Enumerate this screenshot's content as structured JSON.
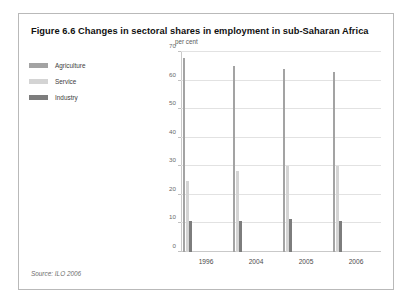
{
  "figure": {
    "title": "Figure 6.6 Changes in sectoral shares in employment in sub-Saharan Africa",
    "source": "Source: ILO 2006"
  },
  "legend": {
    "items": [
      {
        "label": "Agriculture",
        "color": "#a3a3a3"
      },
      {
        "label": "Service",
        "color": "#d4d4d4"
      },
      {
        "label": "Industry",
        "color": "#7d7d7d"
      }
    ]
  },
  "chart_data": {
    "type": "bar",
    "title": "Figure 6.6 Changes in sectoral shares in employment in sub-Saharan Africa",
    "xlabel": "",
    "ylabel": "per cent",
    "ylim": [
      0,
      70
    ],
    "yticks": [
      0,
      10,
      20,
      30,
      40,
      50,
      60,
      70
    ],
    "ytick_labels": [
      "0",
      "10",
      "20",
      "30",
      "40",
      "50",
      "60",
      "70"
    ],
    "grid": true,
    "legend_position": "left",
    "categories": [
      "1996",
      "2004",
      "2005",
      "2006"
    ],
    "series": [
      {
        "name": "Agriculture",
        "color": "#a3a3a3",
        "values": [
          68,
          65,
          64,
          63
        ]
      },
      {
        "name": "Service",
        "color": "#d4d4d4",
        "values": [
          25,
          28.5,
          30,
          30
        ]
      },
      {
        "name": "Industry",
        "color": "#7d7d7d",
        "values": [
          11,
          11,
          11.5,
          11
        ]
      }
    ]
  }
}
